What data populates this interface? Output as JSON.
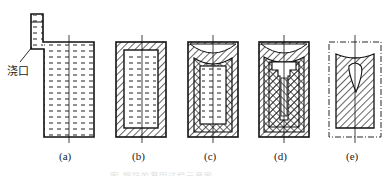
{
  "figure": {
    "gate_label": "浇口",
    "panels": [
      {
        "id": "a",
        "label": "(a)"
      },
      {
        "id": "b",
        "label": "(b)"
      },
      {
        "id": "c",
        "label": "(c)"
      },
      {
        "id": "d",
        "label": "(d)"
      },
      {
        "id": "e",
        "label": "(e)"
      }
    ],
    "caption": "图  钢锭的凝固过程示意图"
  }
}
